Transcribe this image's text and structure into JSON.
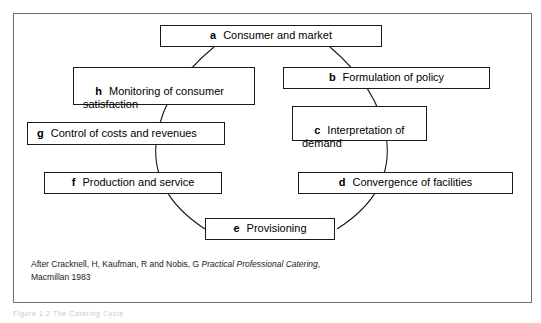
{
  "figure": {
    "frame_color": "#6e6e6e",
    "box_border_color": "#1a1a1a",
    "arc_color": "#1a1a1a",
    "background": "#ffffff"
  },
  "nodes": [
    {
      "id": "a",
      "tag": "a",
      "label": "Consumer and market"
    },
    {
      "id": "b",
      "tag": "b",
      "label": "Formulation of policy"
    },
    {
      "id": "c",
      "tag": "c",
      "label": "Interpretation of\ndemand"
    },
    {
      "id": "d",
      "tag": "d",
      "label": "Convergence of facilities"
    },
    {
      "id": "e",
      "tag": "e",
      "label": "Provisioning"
    },
    {
      "id": "f",
      "tag": "f",
      "label": "Production and service"
    },
    {
      "id": "g",
      "tag": "g",
      "label": "Control of costs and revenues"
    },
    {
      "id": "h",
      "tag": "h",
      "label": "Monitoring of consumer\nsatisfaction"
    }
  ],
  "caption": {
    "line1_plain_start": "After Cracknell, H, Kaufman, R and Nobis, G ",
    "line1_italic": "Practical Professional Catering",
    "line1_plain_end": ",",
    "line2": "Macmillan 1983"
  },
  "undertext": "Figure 1.2  The Catering Cycle"
}
